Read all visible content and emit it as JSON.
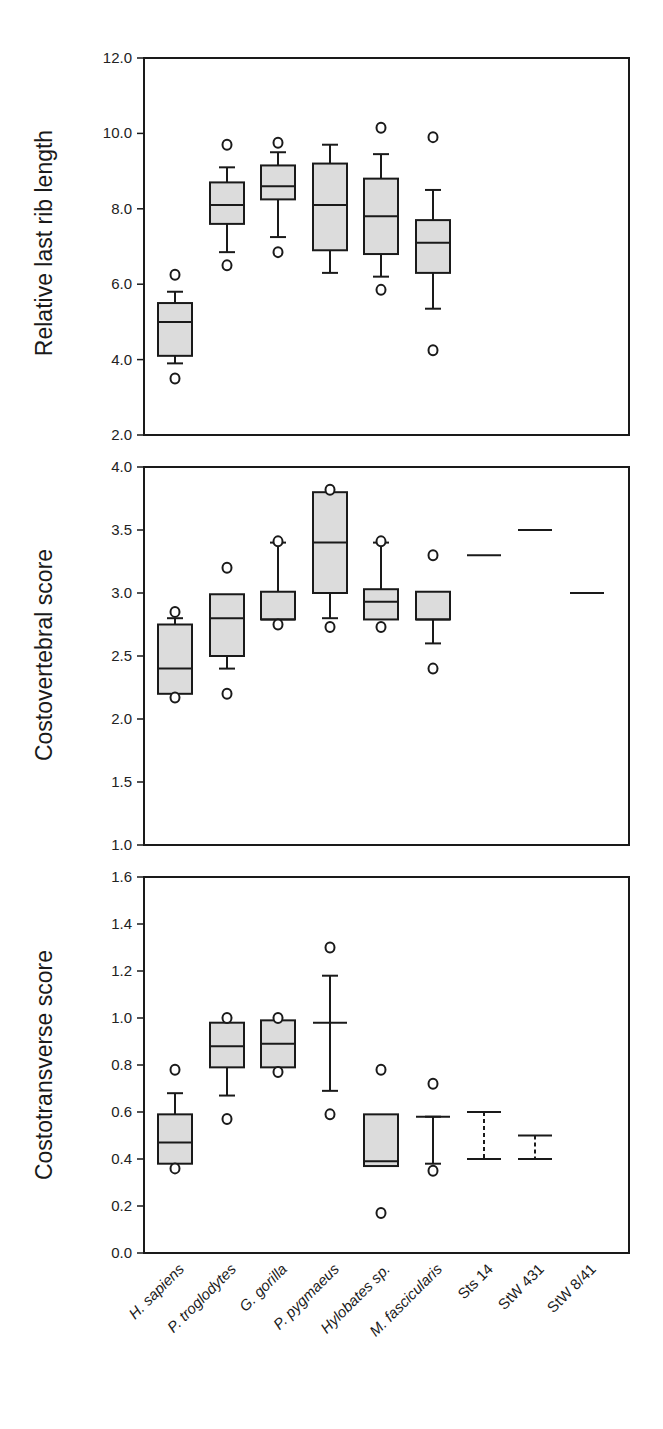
{
  "chart_data": [
    {
      "type": "box",
      "title": "",
      "ylabel": "Relative last rib length",
      "xlabel": "",
      "ylim": [
        2.0,
        12.0
      ],
      "yticks": [
        "12.0",
        "10.0",
        "8.0",
        "6.0",
        "4.0",
        "2.0"
      ],
      "grid": false,
      "categories": [
        "H. sapiens",
        "P. troglodytes",
        "G. gorilla",
        "P. pygmaeus",
        "Hylobates sp.",
        "M. fascicularis",
        "Sts 14",
        "StW 431",
        "StW 8/41"
      ],
      "series": [
        {
          "name": "H. sapiens",
          "q1": 4.1,
          "median": 5.0,
          "q3": 5.5,
          "whisker_low": 3.9,
          "whisker_high": 5.8,
          "outliers": [
            6.25,
            3.5
          ]
        },
        {
          "name": "P. troglodytes",
          "q1": 7.6,
          "median": 8.1,
          "q3": 8.7,
          "whisker_low": 6.85,
          "whisker_high": 9.1,
          "outliers": [
            9.7,
            6.5
          ]
        },
        {
          "name": "G. gorilla",
          "q1": 8.25,
          "median": 8.6,
          "q3": 9.15,
          "whisker_low": 7.25,
          "whisker_high": 9.5,
          "outliers": [
            9.75,
            6.85
          ]
        },
        {
          "name": "P. pygmaeus",
          "q1": 6.9,
          "median": 8.1,
          "q3": 9.2,
          "whisker_low": 6.3,
          "whisker_high": 9.7,
          "outliers": []
        },
        {
          "name": "Hylobates sp.",
          "q1": 6.8,
          "median": 7.8,
          "q3": 8.8,
          "whisker_low": 6.2,
          "whisker_high": 9.45,
          "outliers": [
            10.15,
            5.85
          ]
        },
        {
          "name": "M. fascicularis",
          "q1": 6.3,
          "median": 7.1,
          "q3": 7.7,
          "whisker_low": 5.35,
          "whisker_high": 8.5,
          "outliers": [
            9.9,
            4.25
          ]
        }
      ]
    },
    {
      "type": "box",
      "title": "",
      "ylabel": "Costovertebral score",
      "xlabel": "",
      "ylim": [
        1.0,
        4.0
      ],
      "yticks": [
        "4.0",
        "3.5",
        "3.0",
        "2.5",
        "2.0",
        "1.5",
        "1.0"
      ],
      "grid": false,
      "categories": [
        "H. sapiens",
        "P. troglodytes",
        "G. gorilla",
        "P. pygmaeus",
        "Hylobates sp.",
        "M. fascicularis",
        "Sts 14",
        "StW 431",
        "StW 8/41"
      ],
      "series": [
        {
          "name": "H. sapiens",
          "q1": 2.2,
          "median": 2.4,
          "q3": 2.75,
          "whisker_low": null,
          "whisker_high": 2.8,
          "outliers": [
            2.85,
            2.17
          ]
        },
        {
          "name": "P. troglodytes",
          "q1": 2.5,
          "median": 2.8,
          "q3": 2.99,
          "whisker_low": 2.4,
          "whisker_high": null,
          "outliers": [
            3.2,
            2.2
          ]
        },
        {
          "name": "G. gorilla",
          "q1": 2.79,
          "median": 2.79,
          "q3": 3.01,
          "whisker_low": null,
          "whisker_high": 3.4,
          "outliers": [
            3.41,
            2.75
          ]
        },
        {
          "name": "P. pygmaeus",
          "q1": 3.0,
          "median": 3.4,
          "q3": 3.8,
          "whisker_low": 2.8,
          "whisker_high": null,
          "outliers": [
            3.82,
            2.73
          ]
        },
        {
          "name": "Hylobates sp.",
          "q1": 2.79,
          "median": 2.93,
          "q3": 3.03,
          "whisker_low": null,
          "whisker_high": 3.4,
          "outliers": [
            3.41,
            2.73
          ]
        },
        {
          "name": "M. fascicularis",
          "q1": 2.79,
          "median": 2.79,
          "q3": 3.01,
          "whisker_low": 2.6,
          "whisker_high": null,
          "outliers": [
            3.3,
            2.4
          ]
        },
        {
          "name": "Sts 14",
          "value": 3.3
        },
        {
          "name": "StW 431",
          "value": 3.5
        },
        {
          "name": "StW 8/41",
          "value": 3.0
        }
      ]
    },
    {
      "type": "box",
      "title": "",
      "ylabel": "Costotransverse score",
      "xlabel": "",
      "ylim": [
        0.0,
        1.6
      ],
      "yticks": [
        "1.6",
        "1.4",
        "1.2",
        "1.0",
        "0.8",
        "0.6",
        "0.4",
        "0.2",
        "0.0"
      ],
      "grid": false,
      "categories": [
        "H. sapiens",
        "P. troglodytes",
        "G. gorilla",
        "P. pygmaeus",
        "Hylobates sp.",
        "M. fascicularis",
        "Sts 14",
        "StW 431",
        "StW 8/41"
      ],
      "series": [
        {
          "name": "H. sapiens",
          "q1": 0.38,
          "median": 0.47,
          "q3": 0.59,
          "whisker_low": null,
          "whisker_high": 0.68,
          "outliers": [
            0.78,
            0.36
          ]
        },
        {
          "name": "P. troglodytes",
          "q1": 0.79,
          "median": 0.88,
          "q3": 0.98,
          "whisker_low": 0.67,
          "whisker_high": null,
          "outliers": [
            1.0,
            0.57
          ]
        },
        {
          "name": "G. gorilla",
          "q1": 0.79,
          "median": 0.89,
          "q3": 0.99,
          "whisker_low": null,
          "whisker_high": null,
          "outliers": [
            1.0,
            0.77
          ]
        },
        {
          "name": "P. pygmaeus",
          "q1": null,
          "median": 0.98,
          "q3": null,
          "whisker_low": 0.69,
          "whisker_high": 1.18,
          "outliers": [
            1.3,
            0.59
          ]
        },
        {
          "name": "Hylobates sp.",
          "q1": 0.37,
          "median": 0.39,
          "q3": 0.59,
          "whisker_low": null,
          "whisker_high": null,
          "outliers": [
            0.78,
            0.17
          ]
        },
        {
          "name": "M. fascicularis",
          "q1": null,
          "median": null,
          "q3": null,
          "whisker_low": 0.38,
          "whisker_high": 0.58,
          "outliers": [
            0.72,
            0.35
          ]
        },
        {
          "name": "Sts 14",
          "range_low": 0.4,
          "range_high": 0.6,
          "style": "dashed"
        },
        {
          "name": "StW 431",
          "range_low": 0.4,
          "range_high": 0.5,
          "style": "dashed"
        }
      ]
    }
  ],
  "colors": {
    "box_fill": "#dcdcdc",
    "stroke": "#1a1a1a",
    "background": "#ffffff"
  }
}
